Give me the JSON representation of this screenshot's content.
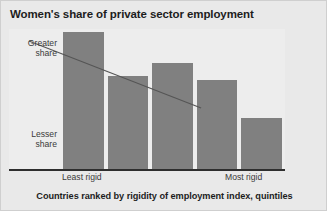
{
  "figure": {
    "title": "Women's share of private sector employment",
    "caption": "Countries ranked by rigidity of employment index, quintiles",
    "background_color": "#e9e9e9",
    "plot_background_color": "#ededed",
    "border_color": "#cfcfcf"
  },
  "axis_annotations": {
    "y_top_label": "Greater\nshare",
    "y_top_line1": "Greater",
    "y_top_line2": "share",
    "y_bottom_line1": "Lesser",
    "y_bottom_line2": "share",
    "x_left_label": "Least rigid",
    "x_right_label": "Most rigid"
  },
  "chart_data": {
    "type": "bar",
    "title": "Women's share of private sector employment",
    "subtitle": "",
    "xlabel": "Countries ranked by rigidity of employment index, quintiles",
    "ylabel": "Women's share of private sector employment",
    "categories": [
      "1",
      "2",
      "3",
      "4",
      "5"
    ],
    "tick_labels": [
      "Least rigid",
      "",
      "",
      "",
      "Most rigid"
    ],
    "y_axis_labels": [
      "Greater share",
      "Lesser share"
    ],
    "values": [
      137,
      93,
      106,
      89,
      51
    ],
    "values_normalized": [
      1.0,
      0.679,
      0.774,
      0.65,
      0.372
    ],
    "ylim": [
      0,
      142
    ],
    "grid": false,
    "legend": null,
    "bar_color": "#808080",
    "baseline_color": "#2e2e2e",
    "annotations": [
      {
        "type": "trendline",
        "label": "downward trend",
        "color": "#555555",
        "x_start_pct": 7.2,
        "y_start_pct": 8.5,
        "x_end_pct": 69.6,
        "y_end_pct": 55.6
      }
    ]
  },
  "bars": [
    {
      "index": 1,
      "left_pct": 19.6,
      "width_pct": 14.9,
      "height_pct": 96.5
    },
    {
      "index": 2,
      "left_pct": 35.9,
      "width_pct": 14.5,
      "height_pct": 65.5
    },
    {
      "index": 3,
      "left_pct": 51.8,
      "width_pct": 14.9,
      "height_pct": 74.6
    },
    {
      "index": 4,
      "left_pct": 68.1,
      "width_pct": 14.5,
      "height_pct": 62.7
    },
    {
      "index": 5,
      "left_pct": 84.1,
      "width_pct": 14.9,
      "height_pct": 35.9
    }
  ]
}
